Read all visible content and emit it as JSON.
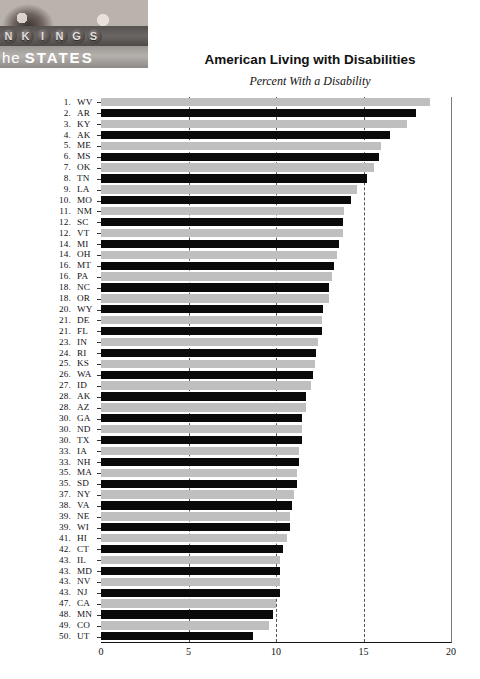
{
  "masthead": {
    "logo_text": "NKINGS",
    "logo_sub_prefix": "he",
    "logo_sub_main": "STATES"
  },
  "header": {
    "title": "American Living with Disabilities",
    "subtitle": "Percent With a Disability"
  },
  "chart_data": {
    "type": "bar",
    "orientation": "horizontal",
    "title": "American Living with Disabilities",
    "subtitle": "Percent With a Disability",
    "xlabel": "",
    "ylabel": "",
    "xlim": [
      0,
      20
    ],
    "xticks": [
      0,
      5,
      10,
      15,
      20
    ],
    "xtick_labels": [
      "0",
      "5",
      "10",
      "15",
      "20"
    ],
    "gridlines": [
      5,
      10,
      15
    ],
    "grid": true,
    "legend": false,
    "bar_colors": [
      "#bfbfbf",
      "#0a0a0a"
    ],
    "categories": [
      "WV",
      "AR",
      "KY",
      "AK",
      "ME",
      "MS",
      "OK",
      "TN",
      "LA",
      "MO",
      "NM",
      "SC",
      "VT",
      "MI",
      "OH",
      "MT",
      "PA",
      "NC",
      "OR",
      "WY",
      "DE",
      "FL",
      "IN",
      "RI",
      "KS",
      "WA",
      "ID",
      "AK",
      "AZ",
      "GA",
      "ND",
      "TX",
      "IA",
      "NH",
      "MA",
      "SD",
      "NY",
      "VA",
      "NE",
      "WI",
      "HI",
      "CT",
      "IL",
      "MD",
      "NV",
      "NJ",
      "CA",
      "MN",
      "CO",
      "UT"
    ],
    "ranks": [
      1,
      2,
      3,
      4,
      5,
      6,
      7,
      8,
      9,
      10,
      11,
      12,
      12,
      14,
      14,
      16,
      16,
      18,
      18,
      20,
      21,
      21,
      23,
      24,
      25,
      26,
      27,
      28,
      28,
      30,
      30,
      30,
      33,
      33,
      35,
      35,
      37,
      38,
      39,
      39,
      41,
      42,
      43,
      43,
      43,
      43,
      47,
      48,
      49,
      50
    ],
    "values": [
      18.8,
      18.0,
      17.5,
      16.5,
      16.0,
      15.9,
      15.6,
      15.2,
      14.6,
      14.3,
      13.9,
      13.8,
      13.8,
      13.6,
      13.5,
      13.3,
      13.2,
      13.0,
      13.0,
      12.7,
      12.6,
      12.6,
      12.4,
      12.3,
      12.2,
      12.1,
      12.0,
      11.7,
      11.7,
      11.5,
      11.5,
      11.5,
      11.3,
      11.3,
      11.2,
      11.2,
      11.0,
      10.9,
      10.8,
      10.8,
      10.6,
      10.4,
      10.2,
      10.2,
      10.2,
      10.2,
      10.0,
      9.8,
      9.6,
      8.7
    ]
  }
}
